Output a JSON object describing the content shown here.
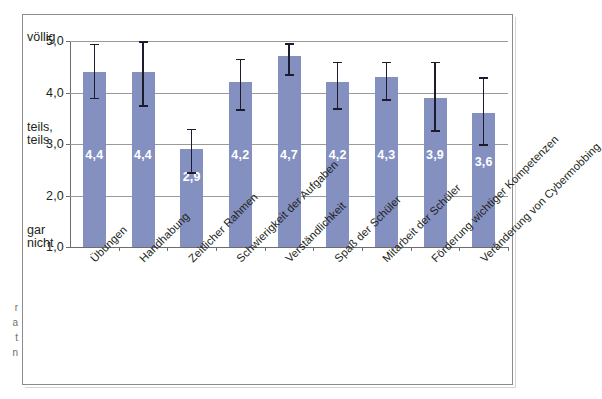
{
  "chart_data": {
    "type": "bar",
    "title": "",
    "xlabel": "",
    "ylabel": "",
    "ylim": [
      1.0,
      5.0
    ],
    "grid": true,
    "legend": "none",
    "y_ticks": [
      "1,0",
      "2,0",
      "3,0",
      "4,0",
      "5,0"
    ],
    "y_tick_values": [
      1.0,
      2.0,
      3.0,
      4.0,
      5.0
    ],
    "y_anchor_labels": [
      {
        "value": 5.0,
        "text": "völlig"
      },
      {
        "value": 3.0,
        "text": "teils,\nteils"
      },
      {
        "value": 1.0,
        "text": "gar\nnicht"
      }
    ],
    "categories": [
      "Übungen",
      "Handhabung",
      "Zeitlicher Rahmen",
      "Schwierigkeit der Aufgaben",
      "Verständlichkeit",
      "Spaß der Schüler",
      "Mitarbeit der Schüler",
      "Förderung wichtiger Kompetenzen",
      "Veränderung von Cybermobbing"
    ],
    "values": [
      4.4,
      4.4,
      2.9,
      4.2,
      4.7,
      4.2,
      4.3,
      3.9,
      3.6
    ],
    "value_labels": [
      "4,4",
      "4,4",
      "2,9",
      "4,2",
      "4,7",
      "4,2",
      "4,3",
      "3,9",
      "3,6"
    ],
    "error_low": [
      3.9,
      3.75,
      2.45,
      3.68,
      4.36,
      3.7,
      3.87,
      3.27,
      3.0
    ],
    "error_high": [
      4.95,
      5.0,
      3.3,
      4.66,
      4.96,
      4.6,
      4.6,
      4.6,
      4.3
    ],
    "bar_color": "#8490c0",
    "error_color": "#1c1c2e",
    "grid_color": "#9a9a9a",
    "axis_color": "#6d6d6d",
    "value_label_color": "#ffffff",
    "background_color": "#ffffff"
  },
  "edge_fragments": [
    "r",
    "a",
    "t",
    "n"
  ]
}
